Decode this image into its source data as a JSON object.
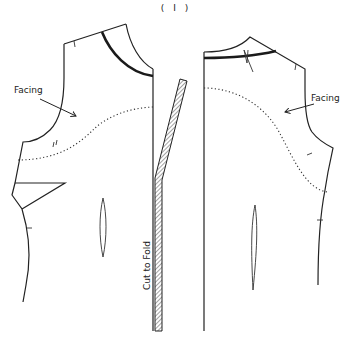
{
  "figure": {
    "label": "( I )",
    "labels": {
      "left_facing": "Facing",
      "right_facing": "Facing",
      "fold": "Cut to Fold"
    },
    "colors": {
      "line": "#222222",
      "background": "#ffffff"
    }
  }
}
